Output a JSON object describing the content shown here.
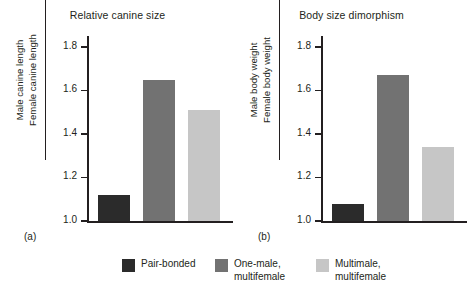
{
  "figure": {
    "background": "#ffffff",
    "ink": "#231f20"
  },
  "chart_data": [
    {
      "type": "bar",
      "panel": "a",
      "panel_label": "(a)",
      "title": "Relative canine size",
      "ylabel_numerator": "Male canine length",
      "ylabel_denominator": "Female canine length",
      "xlabel": "",
      "categories": [
        "Pair-bonded",
        "One-male, multifemale",
        "Multimale, multifemale"
      ],
      "values": [
        1.12,
        1.65,
        1.51
      ],
      "colors": [
        "#2b2b2b",
        "#727272",
        "#c6c6c6"
      ],
      "ylim": [
        1.0,
        1.85
      ],
      "yticks": [
        1.0,
        1.2,
        1.4,
        1.6,
        1.8
      ],
      "ytick_labels": [
        "1.0",
        "1.2",
        "1.4",
        "1.6",
        "1.8"
      ],
      "grid": false,
      "legend_position": "bottom"
    },
    {
      "type": "bar",
      "panel": "b",
      "panel_label": "(b)",
      "title": "Body size dimorphism",
      "ylabel_numerator": "Male body weight",
      "ylabel_denominator": "Female body weight",
      "xlabel": "",
      "categories": [
        "Pair-bonded",
        "One-male, multifemale",
        "Multimale, multifemale"
      ],
      "values": [
        1.08,
        1.67,
        1.34
      ],
      "colors": [
        "#2b2b2b",
        "#727272",
        "#c6c6c6"
      ],
      "ylim": [
        1.0,
        1.85
      ],
      "yticks": [
        1.0,
        1.2,
        1.4,
        1.6,
        1.8
      ],
      "ytick_labels": [
        "1.0",
        "1.2",
        "1.4",
        "1.6",
        "1.8"
      ],
      "grid": false,
      "legend_position": "bottom"
    }
  ],
  "legend": {
    "items": [
      {
        "label": "Pair-bonded",
        "color": "#2b2b2b"
      },
      {
        "label": "One-male,\nmultifemale",
        "color": "#727272"
      },
      {
        "label": "Multimale,\nmultifemale",
        "color": "#c6c6c6"
      }
    ]
  }
}
